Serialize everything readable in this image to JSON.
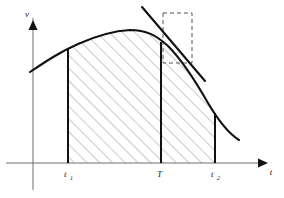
{
  "figure": {
    "background_color": "#ffffff",
    "curve_color": "#111111",
    "hatch_color": "#8a8a8a",
    "axis_color": "#6e6e6e",
    "dashed_color": "#555555"
  },
  "axes": {
    "y_label": "v",
    "x_label": "t",
    "y_axis": {
      "x": 33,
      "top": 14,
      "bottom": 190
    },
    "x_axis": {
      "y": 163,
      "left": 6,
      "right": 268
    }
  },
  "ticks": [
    {
      "name": "t1",
      "base": "t",
      "sub": "1",
      "x": 68,
      "label_x": 64,
      "label_y": 176
    },
    {
      "name": "T",
      "base": "T",
      "sub": "",
      "x": 161,
      "label_x": 158,
      "label_y": 176
    },
    {
      "name": "t2",
      "base": "t",
      "sub": "2",
      "x": 215,
      "label_x": 211,
      "label_y": 176
    }
  ],
  "verticals": [
    {
      "name": "vertical-at-t1",
      "x": 68,
      "y_top": 48,
      "y_bottom": 163
    },
    {
      "name": "vertical-at-T",
      "x": 161,
      "y_top": 42,
      "y_bottom": 163
    },
    {
      "name": "vertical-at-t2",
      "x": 215,
      "y_top": 113,
      "y_bottom": 163
    }
  ],
  "curve": {
    "name": "velocity-curve",
    "path": "M 30,72 C 48,60 60,52 78,44 C 96,36 112,31 130,30 C 146,30 156,35 168,46 C 182,60 196,82 208,103 C 218,120 228,133 239,140",
    "peak_x": 130,
    "peak_y": 30
  },
  "tangent": {
    "name": "tangent-line-at-T",
    "x1": 142,
    "y1": 7,
    "x2": 205,
    "y2": 81
  },
  "dashed_rectangle": {
    "name": "slope-triangle-box",
    "x": 163,
    "y": 13,
    "width": 29,
    "height": 50
  },
  "hatching": {
    "name": "shaded-area-under-curve",
    "angle_deg": 45,
    "spacing_px": 9,
    "region_left": 68,
    "region_right": 215,
    "region_bottom": 163
  }
}
